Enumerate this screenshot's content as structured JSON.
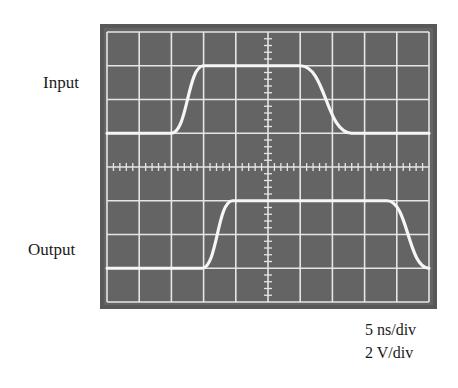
{
  "labels": {
    "input": "Input",
    "output": "Output"
  },
  "scale": {
    "time": "5 ns/div",
    "voltage": "2 V/div"
  },
  "colors": {
    "frame": "#585858",
    "screen": "#646464",
    "grid": "#e6e6e6",
    "trace": "#f4f4f4"
  },
  "chart_data": {
    "type": "line",
    "grid": {
      "x_divisions": 10,
      "y_divisions": 8,
      "minor_ticks_per_division": 5
    },
    "xlabel": "5 ns/div",
    "ylabel": "2 V/div",
    "series": [
      {
        "name": "Input",
        "x_div": [
          0,
          2.0,
          3.0,
          6.0,
          7.6,
          10
        ],
        "y_div_from_top": [
          3,
          3,
          1,
          1,
          3,
          3
        ],
        "note": "low at 3 div, high at 1 div; rise 2→3 div, fall 6→7.6 div"
      },
      {
        "name": "Output",
        "x_div": [
          0,
          2.95,
          3.9,
          8.7,
          10
        ],
        "y_div_from_top": [
          7,
          7,
          5,
          5,
          7
        ],
        "note": "low at 7 div, high at 5 div; rise 2.95→3.9 div, fall 8.7→10 div"
      }
    ]
  }
}
